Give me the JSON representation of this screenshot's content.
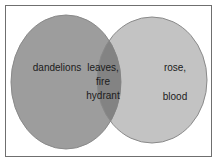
{
  "figure": {
    "type": "venn-diagram",
    "set_count": 2,
    "background_color": "#ffffff",
    "frame_color": "#6f6f6f"
  },
  "colors": {
    "left_circle": "#9d9d9d",
    "right_circle": "#c3c3c3",
    "intersection": "#838383",
    "circle_outline": "#8a8a8a",
    "text": "#1b1b1b"
  },
  "sets": {
    "left": {
      "name": "left-set",
      "label": "dandelions",
      "fill": "#9d9d9d"
    },
    "right": {
      "name": "right-set",
      "label_line_1": "rose,",
      "label_line_2": "blood",
      "fill": "#c3c3c3"
    },
    "intersection": {
      "name": "intersection-set",
      "label": "leaves,\nfire\nhydrant",
      "fill": "#838383"
    }
  }
}
